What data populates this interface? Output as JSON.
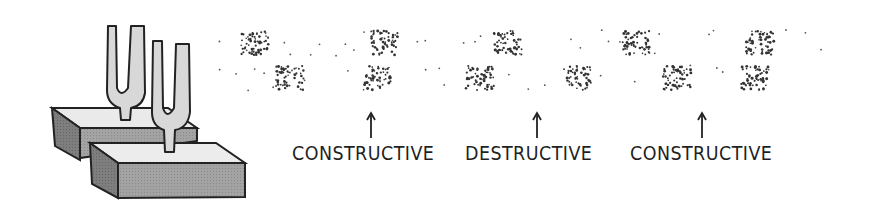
{
  "figure": {
    "title": "",
    "background_color": "#ffffff",
    "ink_color": "#222222",
    "block_colors": {
      "top": "#e6e6e6",
      "front": "#9a9a9a",
      "side": "#7a7a7a"
    },
    "fork_color": "#d6d6d6"
  },
  "labels": [
    {
      "text": "CONSTRUCTIVE",
      "x": 292,
      "arrow_x": 371
    },
    {
      "text": "DESTRUCTIVE",
      "x": 465,
      "arrow_x": 537
    },
    {
      "text": "CONSTRUCTIVE",
      "x": 630,
      "arrow_x": 702
    }
  ],
  "wave_rows": [
    {
      "name": "upper-wave",
      "y": 43,
      "compressions_x": [
        255,
        385,
        508,
        636,
        760
      ]
    },
    {
      "name": "lower-wave",
      "y": 78,
      "compressions_x": [
        290,
        377,
        480,
        578,
        677,
        755
      ]
    }
  ]
}
